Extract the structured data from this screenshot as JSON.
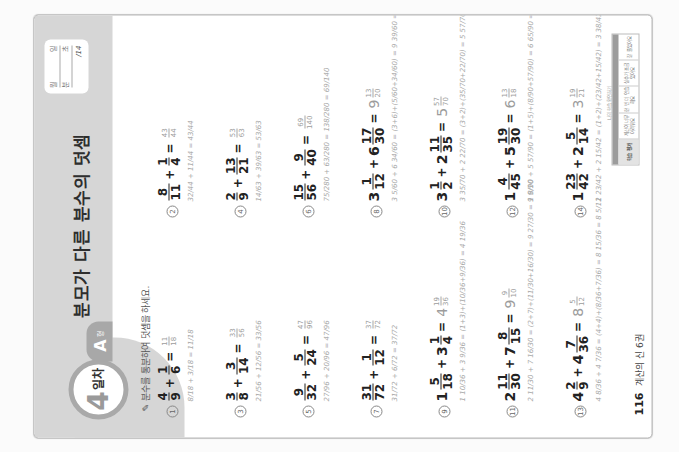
{
  "header": {
    "day_number": "4",
    "day_word": "일차",
    "level_letter": "A",
    "level_suffix": "형",
    "title": "분모가 다른 분수의 덧셈",
    "score": {
      "row1_left": "월",
      "row1_right": "일",
      "row2_left": "분",
      "row2_right": "초",
      "total": "/14"
    }
  },
  "instruction": "분수를 통분하여 덧셈을 하세요.",
  "problems": [
    {
      "num": "1",
      "expr": [
        {
          "n": "4",
          "d": "9"
        },
        "+",
        {
          "n": "1",
          "d": "6"
        }
      ],
      "answer": {
        "w": "",
        "n": "11",
        "d": "18"
      },
      "work": "8/18 + 3/18 = 11/18"
    },
    {
      "num": "2",
      "expr": [
        {
          "n": "8",
          "d": "11"
        },
        "+",
        {
          "n": "1",
          "d": "4"
        }
      ],
      "answer": {
        "w": "",
        "n": "43",
        "d": "44"
      },
      "work": "32/44 + 11/44 = 43/44"
    },
    {
      "num": "3",
      "expr": [
        {
          "n": "3",
          "d": "8"
        },
        "+",
        {
          "n": "3",
          "d": "14"
        }
      ],
      "answer": {
        "w": "",
        "n": "33",
        "d": "56"
      },
      "work": "21/56 + 12/56 = 33/56"
    },
    {
      "num": "4",
      "expr": [
        {
          "n": "2",
          "d": "9"
        },
        "+",
        {
          "n": "13",
          "d": "21"
        }
      ],
      "answer": {
        "w": "",
        "n": "53",
        "d": "63"
      },
      "work": "14/63 + 39/63 = 53/63"
    },
    {
      "num": "5",
      "expr": [
        {
          "n": "9",
          "d": "32"
        },
        "+",
        {
          "n": "5",
          "d": "24"
        }
      ],
      "answer": {
        "w": "",
        "n": "47",
        "d": "96"
      },
      "work": "27/96 + 20/96 = 47/96"
    },
    {
      "num": "6",
      "expr": [
        {
          "n": "15",
          "d": "56"
        },
        "+",
        {
          "n": "9",
          "d": "40"
        }
      ],
      "answer": {
        "w": "",
        "n": "69",
        "d": "140"
      },
      "work": "75/280 + 63/280 = 138/280 = 69/140"
    },
    {
      "num": "7",
      "expr": [
        {
          "n": "31",
          "d": "72"
        },
        "+",
        {
          "n": "1",
          "d": "12"
        }
      ],
      "answer": {
        "w": "",
        "n": "37",
        "d": "72"
      },
      "work": "31/72 + 6/72 = 37/72"
    },
    {
      "num": "8",
      "expr": [
        {
          "w": "3",
          "n": "1",
          "d": "12"
        },
        "+",
        {
          "w": "6",
          "n": "17",
          "d": "30"
        }
      ],
      "answer": {
        "w": "9",
        "n": "13",
        "d": "20"
      },
      "work": "3 5/60 + 6 34/60 = (3+6)+(5/60+34/60) = 9 39/60 = 9 13/20"
    },
    {
      "num": "9",
      "expr": [
        {
          "w": "1",
          "n": "5",
          "d": "18"
        },
        "+",
        {
          "w": "3",
          "n": "1",
          "d": "4"
        }
      ],
      "answer": {
        "w": "4",
        "n": "19",
        "d": "36"
      },
      "work": "1 10/36 + 3 9/36 = (1+3)+(10/36+9/36) = 4 19/36"
    },
    {
      "num": "10",
      "expr": [
        {
          "w": "3",
          "n": "1",
          "d": "2"
        },
        "+",
        {
          "w": "2",
          "n": "11",
          "d": "35"
        }
      ],
      "answer": {
        "w": "5",
        "n": "57",
        "d": "70"
      },
      "work": "3 35/70 + 2 22/70 = (3+2)+(35/70+22/70) = 5 57/70"
    },
    {
      "num": "11",
      "expr": [
        {
          "w": "2",
          "n": "11",
          "d": "30"
        },
        "+",
        {
          "w": "7",
          "n": "8",
          "d": "15"
        }
      ],
      "answer": {
        "w": "9",
        "n": "9",
        "d": "10"
      },
      "work": "2 11/30 + 7 16/30 = (2+7)+(11/30+16/30) = 9 27/30 = 9 9/10"
    },
    {
      "num": "12",
      "expr": [
        {
          "w": "1",
          "n": "4",
          "d": "45"
        },
        "+",
        {
          "w": "5",
          "n": "19",
          "d": "30"
        }
      ],
      "answer": {
        "w": "6",
        "n": "13",
        "d": "18"
      },
      "work": "1 8/90 + 5 57/90 = (1+5)+(8/90+57/90) = 6 65/90 = 6 13/18"
    },
    {
      "num": "13",
      "expr": [
        {
          "w": "4",
          "n": "2",
          "d": "9"
        },
        "+",
        {
          "w": "4",
          "n": "7",
          "d": "36"
        }
      ],
      "answer": {
        "w": "8",
        "n": "5",
        "d": "12"
      },
      "work": "4 8/36 + 4 7/36 = (4+4)+(8/36+7/36) = 8 15/36 = 8 5/12"
    },
    {
      "num": "14",
      "expr": [
        {
          "w": "1",
          "n": "23",
          "d": "42"
        },
        "+",
        {
          "w": "2",
          "n": "5",
          "d": "14"
        }
      ],
      "answer": {
        "w": "3",
        "n": "19",
        "d": "21"
      },
      "work": "1 23/42 + 2 15/42 = (1+2)+(23/42+15/42) = 3 38/42 = 3 19/21"
    }
  ],
  "footer": {
    "page_number": "116",
    "book_label": "계산의 신 6권"
  },
  "study_strip": {
    "caption": "나의 학습 확인하기",
    "cells": [
      "학습 평가",
      "계산이 너무 어려워요",
      "한 번 더 연습해요",
      "실수가 조금 있어요",
      "잘 풀었어요"
    ]
  }
}
